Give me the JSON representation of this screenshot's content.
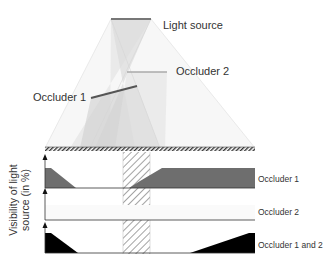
{
  "labels": {
    "light_source": "Light source",
    "occluder_2": "Occluder 2",
    "occluder_1": "Occluder 1"
  },
  "y_axis_label": {
    "line1": "Visibility of light",
    "line2": "source (in %)"
  },
  "graphs": [
    {
      "label": "Occluder 1",
      "fill_color": "#6e6e6e"
    },
    {
      "label": "Occluder 2",
      "fill_color": "#f4f4f4"
    },
    {
      "label": "Occluder 1 and 2",
      "fill_color": "#000000"
    }
  ],
  "colors": {
    "light_source": "#777777",
    "occluder_1": "#555555",
    "occluder_2": "#aaaaaa",
    "ground_hatch": "#444444",
    "hatch_band": "#999999"
  }
}
